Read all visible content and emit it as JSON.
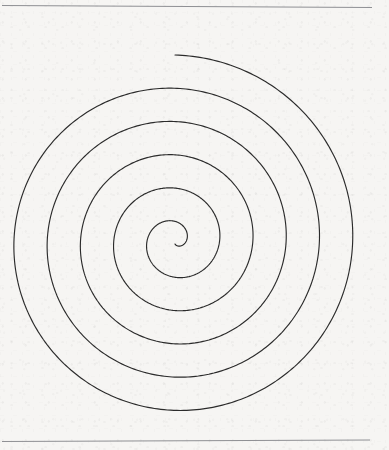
{
  "canvas": {
    "width": 389,
    "height": 450,
    "background_color": "#f6f5f3",
    "description": "Hand-drawn style Archimedean spiral on lightly textured off-white paper with a thin horizontal rule near the top and another near the bottom."
  },
  "rules": [
    {
      "name": "top-rule",
      "x1": 2,
      "y1": 5.5,
      "x2": 372,
      "y2": 7.5,
      "color": "#8f9094",
      "width": 1
    },
    {
      "name": "bottom-rule",
      "x1": 2,
      "y1": 441.5,
      "x2": 370,
      "y2": 440.0,
      "color": "#8f9094",
      "width": 1
    }
  ],
  "spiral": {
    "name": "archimedean-spiral",
    "center_x": 175,
    "center_y": 241,
    "start_radius": 3,
    "end_radius": 186,
    "turns": 5.5,
    "start_angle_deg": -90,
    "direction": "clockwise",
    "stroke_color": "#2b2b2b",
    "stroke_width": 1.15,
    "free_end_point": {
      "x": 170,
      "y": 31
    },
    "inner_end_point": {
      "x": 172,
      "y": 244
    },
    "extent": {
      "left": 29,
      "right": 360,
      "top": 31,
      "bottom": 411
    }
  },
  "chart_data": {
    "type": "line",
    "xlabel": "",
    "ylabel": "",
    "legend": [],
    "grid": false,
    "xlim": [
      0,
      389
    ],
    "ylim": [
      450,
      0
    ],
    "annotations": [],
    "series": [
      {
        "name": "spiral",
        "equation": "r(theta) = a + b*theta",
        "a": 3,
        "b": 5.29,
        "theta_start_rad": 0,
        "theta_end_rad": 34.56,
        "center": [
          175,
          241
        ],
        "turns": 5.5,
        "radius_at_turn": [
          3,
          36,
          69,
          102,
          136,
          169,
          186
        ],
        "color": "#2b2b2b"
      }
    ]
  }
}
